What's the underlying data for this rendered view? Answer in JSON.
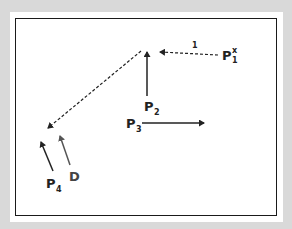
{
  "diagram": {
    "type": "vector-diagram",
    "labels": {
      "p1": {
        "base": "P",
        "sub": "1",
        "sup": "x"
      },
      "p2": {
        "base": "P",
        "sub": "2"
      },
      "p3": {
        "base": "P",
        "sub": "3"
      },
      "p4": {
        "base": "P",
        "sub": "4"
      },
      "d": {
        "text": "D"
      },
      "edge1": {
        "text": "1"
      }
    },
    "arrows": [
      {
        "id": "p1-dashed",
        "style": "dashed",
        "from": "P1",
        "to": "top",
        "label": "1"
      },
      {
        "id": "p2-up",
        "style": "solid",
        "from": "P2",
        "direction": "up"
      },
      {
        "id": "p3-right",
        "style": "solid",
        "from": "P3",
        "direction": "right"
      },
      {
        "id": "diag-dashed",
        "style": "dashed",
        "direction": "down-left"
      },
      {
        "id": "p4-arrow",
        "style": "solid",
        "from": "P4",
        "direction": "up-left"
      },
      {
        "id": "d-arrow",
        "style": "solid",
        "color": "#555555",
        "from": "D",
        "direction": "up-left"
      }
    ],
    "colors": {
      "background": "#d9d9d9",
      "panel": "#ffffff",
      "frame": "#1a1a1a",
      "ink": "#222222",
      "d_ink": "#555555"
    }
  }
}
